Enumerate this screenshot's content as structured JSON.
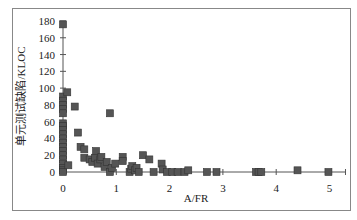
{
  "chart_data": {
    "type": "scatter",
    "title": "",
    "xlabel": "A/FR",
    "ylabel": "单元测试缺陷/KLOC",
    "xlim": [
      0,
      5.3
    ],
    "ylim": [
      0,
      180
    ],
    "xticks": [
      0,
      1,
      2,
      3,
      4,
      5
    ],
    "yticks": [
      0,
      20,
      40,
      60,
      80,
      100,
      120,
      140,
      160,
      180
    ],
    "grid": false,
    "legend": null,
    "marker": "square",
    "marker_color": "#555555",
    "series": [
      {
        "name": "defects",
        "points": [
          [
            0,
            176
          ],
          [
            0,
            90
          ],
          [
            0,
            85
          ],
          [
            0,
            80
          ],
          [
            0,
            75
          ],
          [
            0,
            70
          ],
          [
            0,
            58
          ],
          [
            0,
            55
          ],
          [
            0,
            50
          ],
          [
            0,
            45
          ],
          [
            0,
            40
          ],
          [
            0,
            35
          ],
          [
            0,
            30
          ],
          [
            0,
            25
          ],
          [
            0,
            20
          ],
          [
            0,
            15
          ],
          [
            0,
            10
          ],
          [
            0,
            5
          ],
          [
            0,
            2
          ],
          [
            0,
            0
          ],
          [
            0.08,
            95
          ],
          [
            0.1,
            8
          ],
          [
            0.22,
            78
          ],
          [
            0.28,
            47
          ],
          [
            0.33,
            30
          ],
          [
            0.4,
            27
          ],
          [
            0.4,
            17
          ],
          [
            0.5,
            15
          ],
          [
            0.55,
            12
          ],
          [
            0.6,
            17
          ],
          [
            0.62,
            25
          ],
          [
            0.65,
            10
          ],
          [
            0.7,
            15
          ],
          [
            0.72,
            18
          ],
          [
            0.78,
            6
          ],
          [
            0.82,
            12
          ],
          [
            0.88,
            0
          ],
          [
            0.88,
            70
          ],
          [
            0.92,
            5
          ],
          [
            0.98,
            10
          ],
          [
            1.12,
            18
          ],
          [
            1.12,
            13
          ],
          [
            1.25,
            0
          ],
          [
            1.28,
            4
          ],
          [
            1.3,
            7
          ],
          [
            1.35,
            2
          ],
          [
            1.38,
            5
          ],
          [
            1.42,
            0
          ],
          [
            1.5,
            20
          ],
          [
            1.62,
            15
          ],
          [
            1.7,
            0
          ],
          [
            1.85,
            10
          ],
          [
            1.87,
            3
          ],
          [
            1.95,
            0
          ],
          [
            2.05,
            0
          ],
          [
            2.15,
            0
          ],
          [
            2.28,
            0
          ],
          [
            2.35,
            2
          ],
          [
            2.7,
            0
          ],
          [
            2.88,
            0
          ],
          [
            3.62,
            0
          ],
          [
            3.67,
            0
          ],
          [
            3.72,
            0
          ],
          [
            4.4,
            2
          ],
          [
            4.98,
            0
          ]
        ]
      }
    ]
  }
}
